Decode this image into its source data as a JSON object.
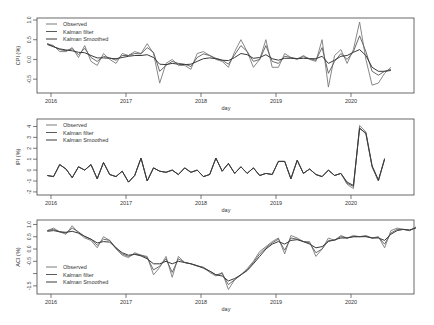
{
  "chart_data": [
    {
      "type": "line",
      "title": "",
      "xlabel": "day",
      "ylabel": "CPI (%)",
      "ylim": [
        -0.8,
        1.0
      ],
      "yticks": [
        1.0,
        0.5,
        0.0,
        -0.5
      ],
      "ytick_labels": [
        "1.0",
        "0.5",
        "0.0",
        "-0.5"
      ],
      "xticks": [
        "2016",
        "2017",
        "2018",
        "2019",
        "2020"
      ],
      "legend": [
        "Observed",
        "Kalman filter",
        "Kalman Smoothed"
      ],
      "legend_position": "top-left",
      "grid": false,
      "x_start": 2015.95,
      "x_step": 0.0833,
      "series": [
        {
          "name": "Observed",
          "values": [
            0.4,
            0.35,
            0.2,
            0.2,
            0.3,
            0.05,
            0.35,
            -0.05,
            -0.15,
            0.15,
            0.0,
            -0.1,
            0.15,
            0.1,
            0.2,
            0.15,
            0.4,
            0.15,
            -0.6,
            -0.1,
            0.0,
            -0.15,
            -0.15,
            -0.25,
            0.15,
            0.2,
            0.1,
            0.0,
            -0.05,
            -0.2,
            0.2,
            0.5,
            0.2,
            -0.2,
            0.0,
            0.5,
            -0.2,
            -0.2,
            0.15,
            0.05,
            0.0,
            0.1,
            0.0,
            -0.05,
            0.5,
            -0.7,
            0.1,
            0.25,
            -0.1,
            0.25,
            0.95,
            0.0,
            -0.65,
            -0.6,
            -0.35,
            -0.2
          ]
        },
        {
          "name": "Kalman filter",
          "values": [
            0.4,
            0.33,
            0.25,
            0.22,
            0.27,
            0.12,
            0.28,
            0.05,
            -0.05,
            0.08,
            0.04,
            -0.02,
            0.1,
            0.1,
            0.15,
            0.14,
            0.3,
            0.18,
            -0.3,
            -0.15,
            -0.05,
            -0.1,
            -0.12,
            -0.18,
            0.05,
            0.14,
            0.1,
            0.03,
            -0.02,
            -0.12,
            0.12,
            0.35,
            0.2,
            -0.05,
            0.0,
            0.35,
            -0.05,
            -0.1,
            0.08,
            0.05,
            0.02,
            0.07,
            0.02,
            -0.02,
            0.3,
            -0.35,
            -0.05,
            0.15,
            0.0,
            0.2,
            0.6,
            0.2,
            -0.3,
            -0.4,
            -0.3,
            -0.25
          ]
        },
        {
          "name": "Kalman Smoothed",
          "values": [
            0.38,
            0.32,
            0.27,
            0.24,
            0.22,
            0.18,
            0.17,
            0.1,
            0.04,
            0.04,
            0.03,
            0.02,
            0.05,
            0.08,
            0.1,
            0.1,
            0.12,
            0.05,
            -0.12,
            -0.13,
            -0.1,
            -0.12,
            -0.13,
            -0.12,
            -0.05,
            0.02,
            0.04,
            0.02,
            -0.02,
            -0.03,
            0.05,
            0.15,
            0.12,
            0.03,
            0.05,
            0.12,
            0.02,
            -0.02,
            0.03,
            0.03,
            0.02,
            0.03,
            0.02,
            0.02,
            0.08,
            -0.1,
            -0.02,
            0.08,
            0.1,
            0.18,
            0.25,
            0.1,
            -0.2,
            -0.3,
            -0.3,
            -0.28
          ]
        }
      ]
    },
    {
      "type": "line",
      "title": "",
      "xlabel": "day",
      "ylabel": "IPI (%)",
      "ylim": [
        -2.1,
        4.5
      ],
      "yticks": [
        4,
        3,
        2,
        1,
        0,
        -1,
        -2
      ],
      "ytick_labels": [
        "4",
        "3",
        "2",
        "1",
        "0",
        "-1",
        "-2"
      ],
      "xticks": [
        "2016",
        "2017",
        "2018",
        "2019",
        "2020"
      ],
      "legend": [
        "Observed",
        "Kalman filter",
        "Kalman Smoothed"
      ],
      "legend_position": "top-left",
      "grid": false,
      "x_start": 2015.95,
      "x_step": 0.0833,
      "series": [
        {
          "name": "Observed",
          "values": [
            -0.5,
            -0.6,
            0.5,
            0.1,
            -0.7,
            0.3,
            0.0,
            0.5,
            -0.8,
            0.7,
            -0.4,
            -0.6,
            -0.1,
            -1.1,
            -0.5,
            1.1,
            -1.0,
            0.2,
            -0.1,
            -0.2,
            0.0,
            -0.4,
            0.2,
            -0.2,
            0.0,
            -0.6,
            -0.4,
            1.1,
            -0.1,
            0.6,
            -0.3,
            0.3,
            -0.3,
            0.2,
            -0.5,
            -0.3,
            -0.4,
            0.8,
            0.8,
            -0.8,
            0.9,
            -0.3,
            0.1,
            -0.4,
            -0.6,
            0.0,
            -0.5,
            -0.3,
            -1.3,
            -1.7,
            4.1,
            3.5,
            0.3,
            -1.0,
            1.1
          ]
        },
        {
          "name": "Kalman filter",
          "values": [
            -0.5,
            -0.6,
            0.5,
            0.1,
            -0.7,
            0.3,
            0.0,
            0.5,
            -0.8,
            0.7,
            -0.4,
            -0.6,
            -0.1,
            -1.1,
            -0.5,
            1.1,
            -1.0,
            0.2,
            -0.1,
            -0.2,
            0.0,
            -0.4,
            0.2,
            -0.2,
            0.0,
            -0.6,
            -0.4,
            1.1,
            -0.1,
            0.6,
            -0.3,
            0.3,
            -0.3,
            0.2,
            -0.5,
            -0.3,
            -0.4,
            0.8,
            0.8,
            -0.8,
            0.9,
            -0.3,
            0.1,
            -0.4,
            -0.6,
            0.0,
            -0.5,
            -0.3,
            -1.2,
            -1.5,
            3.9,
            3.3,
            0.3,
            -1.0,
            1.0
          ]
        },
        {
          "name": "Kalman Smoothed",
          "values": [
            -0.5,
            -0.6,
            0.5,
            0.1,
            -0.7,
            0.3,
            0.0,
            0.5,
            -0.8,
            0.7,
            -0.4,
            -0.6,
            -0.1,
            -1.1,
            -0.5,
            1.1,
            -1.0,
            0.2,
            -0.1,
            -0.2,
            0.0,
            -0.4,
            0.2,
            -0.2,
            0.0,
            -0.6,
            -0.4,
            1.1,
            -0.1,
            0.6,
            -0.3,
            0.3,
            -0.3,
            0.2,
            -0.5,
            -0.3,
            -0.4,
            0.8,
            0.8,
            -0.8,
            0.9,
            -0.3,
            0.1,
            -0.4,
            -0.6,
            0.0,
            -0.5,
            -0.3,
            -1.1,
            -1.4,
            3.8,
            3.4,
            0.4,
            -0.9,
            1.0
          ]
        }
      ]
    },
    {
      "type": "line",
      "title": "",
      "xlabel": "day",
      "ylabel": "ACI (%)",
      "ylim": [
        -1.75,
        1.1
      ],
      "yticks": [
        1.0,
        0.5,
        0.0,
        -0.5,
        -1.0,
        -1.5
      ],
      "ytick_labels": [
        "1.0",
        "0.5",
        "0.0",
        "-0.5",
        "",
        "-1.5"
      ],
      "xticks": [
        "2016",
        "2017",
        "2018",
        "2019",
        "2020"
      ],
      "legend": [
        "Observed",
        "Kalman filter",
        "Kalman Smoothed"
      ],
      "legend_position": "bottom-left",
      "grid": false,
      "x_start": 2015.95,
      "x_step": 0.0833,
      "series": [
        {
          "name": "Observed",
          "values": [
            0.75,
            0.85,
            0.7,
            0.6,
            0.95,
            0.65,
            0.45,
            0.35,
            0.05,
            0.5,
            0.35,
            0.0,
            -0.25,
            -0.35,
            -0.15,
            -0.25,
            -0.3,
            -1.05,
            -0.75,
            -0.3,
            -1.15,
            -0.3,
            -0.55,
            -0.6,
            -0.7,
            -0.75,
            -0.95,
            -1.1,
            -0.95,
            -1.65,
            -1.25,
            -1.05,
            -0.8,
            -0.5,
            -0.1,
            0.1,
            0.3,
            0.45,
            -0.2,
            0.55,
            0.45,
            0.3,
            0.3,
            -0.3,
            0.0,
            0.45,
            0.35,
            0.55,
            0.45,
            0.55,
            0.5,
            0.55,
            0.45,
            0.5,
            0.05,
            0.75,
            0.85,
            0.8,
            0.75,
            0.9
          ]
        },
        {
          "name": "Kalman filter",
          "values": [
            0.75,
            0.8,
            0.7,
            0.65,
            0.85,
            0.7,
            0.5,
            0.4,
            0.15,
            0.4,
            0.35,
            0.05,
            -0.2,
            -0.3,
            -0.2,
            -0.25,
            -0.35,
            -0.85,
            -0.7,
            -0.4,
            -0.95,
            -0.4,
            -0.55,
            -0.6,
            -0.68,
            -0.75,
            -0.9,
            -1.05,
            -1.0,
            -1.45,
            -1.25,
            -1.05,
            -0.85,
            -0.55,
            -0.2,
            0.05,
            0.25,
            0.4,
            -0.05,
            0.45,
            0.4,
            0.3,
            0.25,
            -0.15,
            0.0,
            0.35,
            0.35,
            0.5,
            0.45,
            0.5,
            0.5,
            0.52,
            0.45,
            0.48,
            0.2,
            0.65,
            0.8,
            0.8,
            0.75,
            0.88
          ]
        },
        {
          "name": "Kalman Smoothed",
          "values": [
            0.72,
            0.75,
            0.7,
            0.68,
            0.72,
            0.65,
            0.52,
            0.4,
            0.25,
            0.3,
            0.28,
            0.05,
            -0.15,
            -0.25,
            -0.22,
            -0.28,
            -0.4,
            -0.6,
            -0.6,
            -0.5,
            -0.6,
            -0.5,
            -0.55,
            -0.6,
            -0.68,
            -0.78,
            -0.9,
            -1.05,
            -1.1,
            -1.3,
            -1.2,
            -1.05,
            -0.88,
            -0.6,
            -0.3,
            0.0,
            0.2,
            0.3,
            0.2,
            0.35,
            0.38,
            0.3,
            0.2,
            0.05,
            0.1,
            0.3,
            0.38,
            0.45,
            0.45,
            0.5,
            0.5,
            0.5,
            0.45,
            0.45,
            0.35,
            0.6,
            0.75,
            0.8,
            0.78,
            0.85
          ]
        }
      ]
    }
  ],
  "panels": [
    {
      "ylabel": "CPI (%)",
      "xlabel": "day",
      "legend": [
        "Observed",
        "Kalman filter",
        "Kalman Smoothed"
      ]
    },
    {
      "ylabel": "IPI (%)",
      "xlabel": "day",
      "legend": [
        "Observed",
        "Kalman filter",
        "Kalman Smoothed"
      ]
    },
    {
      "ylabel": "ACI (%)",
      "xlabel": "day",
      "legend": [
        "Observed",
        "Kalman filter",
        "Kalman Smoothed"
      ]
    }
  ],
  "colors": {
    "observed": "#7a7a7a",
    "kalman_filter": "#5a5a5a",
    "kalman_smoothed": "#3a3a3a",
    "axis": "#444444",
    "text": "#333333"
  }
}
